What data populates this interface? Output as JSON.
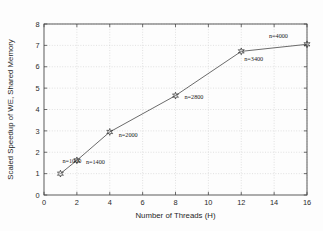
{
  "chart_data": {
    "type": "line",
    "title": "",
    "xlabel": "Number of Threads (H)",
    "ylabel": "Scaled Speedup of WE, Shared Memory",
    "xlim": [
      0,
      16
    ],
    "ylim": [
      0,
      8
    ],
    "xticks": [
      0,
      2,
      4,
      6,
      8,
      10,
      12,
      14,
      16
    ],
    "yticks": [
      0,
      1,
      2,
      3,
      4,
      5,
      6,
      7,
      8
    ],
    "xticklabels": [
      "0",
      "2",
      "4",
      "6",
      "8",
      "10",
      "12",
      "14",
      "16"
    ],
    "yticklabels": [
      "0",
      "1",
      "2",
      "3",
      "4",
      "5",
      "6",
      "7",
      "8"
    ],
    "grid": true,
    "grid_style": "dotted",
    "legend": "none",
    "marker": "hexagram-star",
    "line_color": "#5a5a5a",
    "marker_color": "#3a3a3a",
    "x": [
      1,
      2,
      4,
      8,
      12,
      16
    ],
    "values": [
      1.0,
      1.62,
      2.95,
      4.65,
      6.72,
      7.05
    ],
    "point_labels": [
      "n=1000",
      "n=1400",
      "n=2000",
      "n=2800",
      "n=3400",
      "n=4000"
    ],
    "series": [
      {
        "name": "Scaled Speedup of WE, Shared Memory",
        "x": [
          1,
          2,
          4,
          8,
          12,
          16
        ],
        "values": [
          1.0,
          1.62,
          2.95,
          4.65,
          6.72,
          7.05
        ]
      }
    ],
    "annotations": [
      {
        "text": "n=1000",
        "x": 1,
        "y": 1.0,
        "dx": 2,
        "dy": -11
      },
      {
        "text": "n=1400",
        "x": 2,
        "y": 1.62,
        "dx": 9,
        "dy": 4
      },
      {
        "text": "n=2000",
        "x": 4,
        "y": 2.95,
        "dx": 9,
        "dy": 5
      },
      {
        "text": "n=2800",
        "x": 8,
        "y": 4.65,
        "dx": 9,
        "dy": 3
      },
      {
        "text": "n=3400",
        "x": 12,
        "y": 6.72,
        "dx": 3,
        "dy": 10
      },
      {
        "text": "n=4000",
        "x": 16,
        "y": 7.05,
        "dx": -38,
        "dy": -6
      }
    ]
  },
  "figure": {
    "background_color": "#fdfdfd",
    "axis_color": "#4a4a4a",
    "grid_color": "#cfcfcf"
  }
}
